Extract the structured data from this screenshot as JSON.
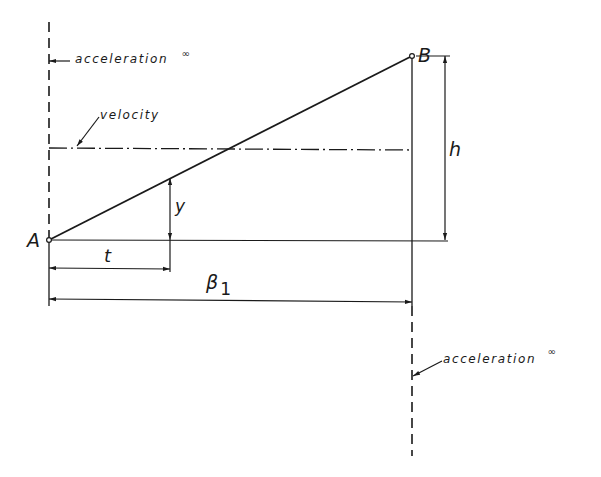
{
  "diagram": {
    "type": "technical-drawing",
    "colors": {
      "ink": "#1a1a1a",
      "background": "#ffffff"
    },
    "points": {
      "A": {
        "label": "A",
        "x": 49,
        "y": 240
      },
      "B": {
        "label": "B",
        "x": 412,
        "y": 56
      }
    },
    "labels": {
      "acceleration_top": "acceleration",
      "acceleration_top_sup": "∞",
      "velocity": "velocity",
      "acceleration_bottom": "acceleration",
      "acceleration_bottom_sup": "∞",
      "y": "y",
      "t": "t",
      "beta": "β",
      "beta_sub": "1",
      "h": "h"
    },
    "lines": {
      "left_boundary": "dashed vertical line at A (acceleration ∞)",
      "right_boundary": "dashed vertical line at B (acceleration ∞)",
      "velocity_line": "dash-dot horizontal line (velocity)",
      "ramp": "straight line from A to B",
      "baseline": "horizontal line through A"
    },
    "dimensions": [
      {
        "name": "y",
        "from": "baseline",
        "to": "ramp",
        "orientation": "vertical"
      },
      {
        "name": "t",
        "from": "A",
        "to": "y-dimension",
        "orientation": "horizontal"
      },
      {
        "name": "β1",
        "from": "A",
        "to": "B-vertical",
        "orientation": "horizontal"
      },
      {
        "name": "h",
        "from": "baseline",
        "to": "B",
        "orientation": "vertical"
      }
    ]
  }
}
